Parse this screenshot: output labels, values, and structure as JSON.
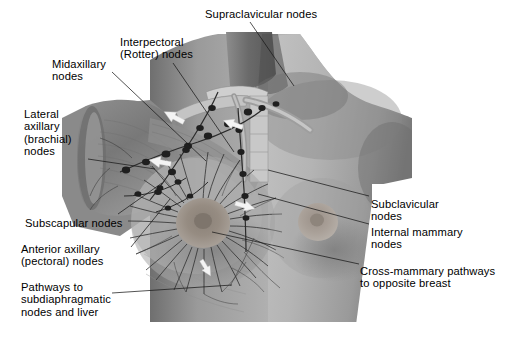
{
  "figure": {
    "type": "anatomical-illustration",
    "style": "grayscale halftone medical drawing",
    "background_color": "#ffffff",
    "text_color": "#000000",
    "leader_line_color": "#1a1a1a",
    "canvas": {
      "width": 513,
      "height": 339
    },
    "illustration_bounds": {
      "x": 62,
      "y": 32,
      "width": 350,
      "height": 293
    }
  },
  "labels": [
    {
      "id": "supraclavicular",
      "text": "Supraclavicular nodes",
      "x": 205,
      "y": 8,
      "align": "left"
    },
    {
      "id": "interpectoral",
      "text": "Interpectoral\n(Rotter) nodes",
      "x": 120,
      "y": 36,
      "align": "left"
    },
    {
      "id": "midaxillary",
      "text": "Midaxillary\nnodes",
      "x": 52,
      "y": 58,
      "align": "left"
    },
    {
      "id": "lateral-axillary",
      "text": "Lateral\naxillary\n(brachial)\nnodes",
      "x": 24,
      "y": 108,
      "align": "left"
    },
    {
      "id": "subscapular",
      "text": "Subscapular nodes",
      "x": 25,
      "y": 217,
      "align": "left"
    },
    {
      "id": "anterior-axillary",
      "text": "Anterior axillary\n(pectoral) nodes",
      "x": 21,
      "y": 243,
      "align": "left"
    },
    {
      "id": "pathways-subdiaphragmatic",
      "text": "Pathways to\nsubdiaphragmatic\nnodes and liver",
      "x": 21,
      "y": 281,
      "align": "left"
    },
    {
      "id": "subclavicular",
      "text": "Subclavicular\nnodes",
      "x": 371,
      "y": 198,
      "align": "left"
    },
    {
      "id": "internal-mammary",
      "text": "Internal mammary\nnodes",
      "x": 371,
      "y": 226,
      "align": "left"
    },
    {
      "id": "cross-mammary",
      "text": "Cross-mammary pathways\nto opposite breast",
      "x": 360,
      "y": 265,
      "align": "left"
    }
  ],
  "leader_lines": [
    {
      "id": "leader-supraclavicular",
      "from": [
        250,
        22
      ],
      "to": [
        294,
        86
      ]
    },
    {
      "id": "leader-interpectoral",
      "from": [
        173,
        63
      ],
      "to": [
        234,
        152
      ]
    },
    {
      "id": "leader-midaxillary",
      "from": [
        112,
        72
      ],
      "to": [
        206,
        161
      ]
    },
    {
      "id": "leader-lateral-axillary",
      "from": [
        88,
        159
      ],
      "to": [
        155,
        169
      ]
    },
    {
      "id": "leader-subscapular",
      "from": [
        118,
        214
      ],
      "to": [
        162,
        183
      ]
    },
    {
      "id": "leader-anterior-axillary",
      "from": [
        131,
        247
      ],
      "to": [
        170,
        199
      ]
    },
    {
      "id": "leader-pathways",
      "from": [
        112,
        293
      ],
      "to": [
        232,
        285
      ]
    },
    {
      "id": "leader-subclavicular",
      "from": [
        369,
        196
      ],
      "to": [
        268,
        170
      ]
    },
    {
      "id": "leader-internal-mammary",
      "from": [
        369,
        224
      ],
      "to": [
        258,
        194
      ]
    },
    {
      "id": "leader-cross-mammary",
      "from": [
        359,
        264
      ],
      "to": [
        212,
        232
      ]
    }
  ],
  "anatomy": {
    "regions": [
      {
        "name": "neck",
        "description": "shaded neck column"
      },
      {
        "name": "clavicle",
        "description": "clavicle and supraclavicular fossa"
      },
      {
        "name": "dissected-axilla",
        "description": "cut-away upper arm showing axillary contents"
      },
      {
        "name": "left-breast-dissected",
        "description": "breast with radiating lymphatic vessels around areola"
      },
      {
        "name": "right-breast-intact",
        "description": "intact opposite breast with nipple"
      },
      {
        "name": "rib-cage",
        "description": "shaded chest wall and ribs"
      }
    ],
    "drainage_arrows": [
      {
        "name": "arrow-axillary-upward",
        "x": 174,
        "y": 117,
        "angle": -62
      },
      {
        "name": "arrow-pectoral-upward",
        "x": 160,
        "y": 160,
        "angle": -78
      },
      {
        "name": "arrow-internal-upward",
        "x": 232,
        "y": 124,
        "angle": -70
      },
      {
        "name": "arrow-cross-mammary",
        "x": 243,
        "y": 205,
        "angle": 18
      },
      {
        "name": "arrow-subdiaphragmatic",
        "x": 205,
        "y": 268,
        "angle": 62
      }
    ]
  }
}
